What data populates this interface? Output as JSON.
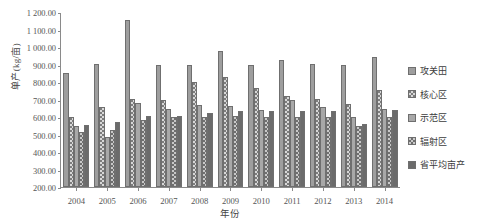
{
  "chart_data": {
    "type": "bar",
    "title": "",
    "xlabel": "年份",
    "ylabel": "单产(kg/亩)",
    "ylim": [
      200,
      1200
    ],
    "ytick_step": 100,
    "grid": false,
    "legend_position": "right",
    "categories": [
      "2004",
      "2005",
      "2006",
      "2007",
      "2008",
      "2009",
      "2010",
      "2011",
      "2012",
      "2013",
      "2014"
    ],
    "yticks": [
      "1 200.00",
      "1 100.00",
      "1 000.00",
      "900.00",
      "800.00",
      "700.00",
      "600.00",
      "500.00",
      "400.00",
      "300.00",
      "200.00"
    ],
    "series": [
      {
        "name": "攻关田",
        "color": "#9e9e9e",
        "pattern": "solid-light",
        "values": [
          853,
          903,
          1152,
          897,
          898,
          977,
          899,
          925,
          905,
          897,
          945
        ]
      },
      {
        "name": "核心区",
        "color": "#d8d8d8",
        "pattern": "dotted",
        "values": [
          600,
          658,
          702,
          700,
          802,
          830,
          765,
          720,
          705,
          672,
          755
        ]
      },
      {
        "name": "示范区",
        "color": "#a8a8a8",
        "pattern": "solid-mid",
        "values": [
          547,
          487,
          678,
          645,
          670,
          665,
          640,
          695,
          655,
          600,
          648
        ]
      },
      {
        "name": "辐射区",
        "color": "#c9c9c9",
        "pattern": "hatched",
        "values": [
          512,
          525,
          585,
          600,
          600,
          608,
          600,
          600,
          602,
          550,
          600
        ]
      },
      {
        "name": "省平均亩产",
        "color": "#6b6b6b",
        "pattern": "solid-dark",
        "values": [
          553,
          572,
          608,
          608,
          623,
          632,
          633,
          635,
          632,
          558,
          638
        ]
      }
    ]
  }
}
